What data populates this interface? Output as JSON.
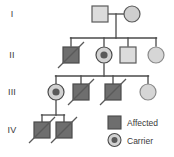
{
  "diagram": {
    "type": "pedigree-chart",
    "colors": {
      "affected_fill": "#6e6e6e",
      "unaffected_fill": "#dcdcdc",
      "carrier_dot": "#5a5a5a",
      "stroke": "#5a5a5a",
      "line": "#4a4a4a",
      "text": "#3a3a3a",
      "background": "#ffffff"
    },
    "generation_labels": [
      {
        "id": "gen-1",
        "label": "I",
        "x": 12,
        "y": 17
      },
      {
        "id": "gen-2",
        "label": "II",
        "x": 10,
        "y": 58
      },
      {
        "id": "gen-3",
        "label": "III",
        "x": 8,
        "y": 95
      },
      {
        "id": "gen-4",
        "label": "IV",
        "x": 7,
        "y": 133
      }
    ],
    "individuals": [
      {
        "id": "I-1",
        "generation": "I",
        "sex": "male",
        "status": "unaffected",
        "deceased": false,
        "cx": 100,
        "cy": 14
      },
      {
        "id": "I-2",
        "generation": "I",
        "sex": "female",
        "status": "unaffected",
        "deceased": false,
        "cx": 132,
        "cy": 14
      },
      {
        "id": "II-1",
        "generation": "II",
        "sex": "male",
        "status": "affected",
        "deceased": true,
        "cx": 71,
        "cy": 55
      },
      {
        "id": "II-2",
        "generation": "II",
        "sex": "female",
        "status": "carrier",
        "deceased": false,
        "cx": 104,
        "cy": 55
      },
      {
        "id": "II-3",
        "generation": "II",
        "sex": "male",
        "status": "unaffected",
        "deceased": false,
        "cx": 128,
        "cy": 55
      },
      {
        "id": "II-4",
        "generation": "II",
        "sex": "female",
        "status": "unaffected",
        "deceased": false,
        "cx": 156,
        "cy": 55
      },
      {
        "id": "III-1",
        "generation": "III",
        "sex": "female",
        "status": "carrier",
        "deceased": false,
        "cx": 56,
        "cy": 92
      },
      {
        "id": "III-2",
        "generation": "III",
        "sex": "male",
        "status": "affected",
        "deceased": true,
        "cx": 81,
        "cy": 92
      },
      {
        "id": "III-3",
        "generation": "III",
        "sex": "male",
        "status": "affected",
        "deceased": true,
        "cx": 113,
        "cy": 92
      },
      {
        "id": "III-4",
        "generation": "III",
        "sex": "female",
        "status": "unaffected",
        "deceased": false,
        "cx": 148,
        "cy": 92
      },
      {
        "id": "IV-1",
        "generation": "IV",
        "sex": "male",
        "status": "affected",
        "deceased": true,
        "cx": 42,
        "cy": 130
      },
      {
        "id": "IV-2",
        "generation": "IV",
        "sex": "male",
        "status": "affected",
        "deceased": true,
        "cx": 64,
        "cy": 130
      }
    ],
    "connections": [
      {
        "id": "mating-I",
        "type": "mating-line",
        "x1": 108,
        "y1": 14,
        "x2": 124,
        "y2": 14
      },
      {
        "id": "descent-I",
        "type": "descent-line",
        "x1": 116,
        "y1": 14,
        "x2": 116,
        "y2": 38
      },
      {
        "id": "sibship-II",
        "type": "sibship-line",
        "x1": 71,
        "y1": 38,
        "x2": 156,
        "y2": 38
      },
      {
        "id": "drop-II-1",
        "type": "drop-line",
        "x1": 71,
        "y1": 38,
        "x2": 71,
        "y2": 46
      },
      {
        "id": "drop-II-2",
        "type": "drop-line",
        "x1": 104,
        "y1": 38,
        "x2": 104,
        "y2": 46
      },
      {
        "id": "drop-II-3",
        "type": "drop-line",
        "x1": 128,
        "y1": 38,
        "x2": 128,
        "y2": 46
      },
      {
        "id": "drop-II-4",
        "type": "drop-line",
        "x1": 156,
        "y1": 38,
        "x2": 156,
        "y2": 46
      },
      {
        "id": "descent-II",
        "type": "descent-line",
        "x1": 104,
        "y1": 64,
        "x2": 104,
        "y2": 76
      },
      {
        "id": "sibship-III",
        "type": "sibship-line",
        "x1": 56,
        "y1": 76,
        "x2": 148,
        "y2": 76
      },
      {
        "id": "drop-III-1",
        "type": "drop-line",
        "x1": 56,
        "y1": 76,
        "x2": 56,
        "y2": 84
      },
      {
        "id": "drop-III-2",
        "type": "drop-line",
        "x1": 81,
        "y1": 76,
        "x2": 81,
        "y2": 84
      },
      {
        "id": "drop-III-3",
        "type": "drop-line",
        "x1": 113,
        "y1": 76,
        "x2": 113,
        "y2": 84
      },
      {
        "id": "drop-III-4",
        "type": "drop-line",
        "x1": 148,
        "y1": 76,
        "x2": 148,
        "y2": 84
      },
      {
        "id": "descent-III",
        "type": "descent-line",
        "x1": 56,
        "y1": 100,
        "x2": 56,
        "y2": 115
      },
      {
        "id": "sibship-IV",
        "type": "sibship-line",
        "x1": 42,
        "y1": 115,
        "x2": 64,
        "y2": 115
      },
      {
        "id": "drop-IV-1",
        "type": "drop-line",
        "x1": 42,
        "y1": 115,
        "x2": 42,
        "y2": 122
      },
      {
        "id": "drop-IV-2",
        "type": "drop-line",
        "x1": 64,
        "y1": 115,
        "x2": 64,
        "y2": 122
      }
    ],
    "legend": {
      "items": [
        {
          "id": "legend-affected",
          "symbol": "filled-square",
          "label": "Affected",
          "x": 115,
          "y": 122
        },
        {
          "id": "legend-carrier",
          "symbol": "carrier-circle",
          "label": "Carrier",
          "x": 115,
          "y": 141
        }
      ]
    }
  }
}
